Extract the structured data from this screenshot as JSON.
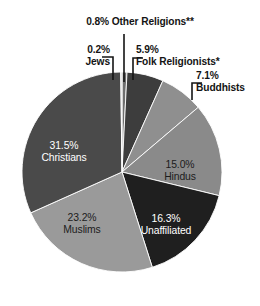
{
  "chart_data": {
    "type": "pie",
    "title": "",
    "subtitle": "",
    "xlabel": "",
    "ylabel": "",
    "legend_position": "none",
    "grid": false,
    "units": "percent",
    "total": 100.0,
    "start_angle_deg": 0,
    "direction": "clockwise",
    "categories": [
      "Other Religions**",
      "Folk Religionists*",
      "Buddhists",
      "Hindus",
      "Unaffiliated",
      "Muslims",
      "Christians",
      "Jews"
    ],
    "values": [
      0.8,
      5.9,
      7.1,
      15.0,
      16.3,
      23.2,
      31.5,
      0.2
    ],
    "slices": [
      {
        "name": "Other Religions**",
        "value": 0.8,
        "pct_label": "0.8%",
        "name_label": "Other Religions**",
        "color": "#6f6f6f",
        "label_placement": "callout",
        "text_color": "#141414"
      },
      {
        "name": "Folk Religionists*",
        "value": 5.9,
        "pct_label": "5.9%",
        "name_label": "Folk Religionists*",
        "color": "#3d3d3d",
        "label_placement": "callout",
        "text_color": "#141414"
      },
      {
        "name": "Buddhists",
        "value": 7.1,
        "pct_label": "7.1%",
        "name_label": "Buddhists",
        "color": "#8f8f8f",
        "label_placement": "callout",
        "text_color": "#141414"
      },
      {
        "name": "Hindus",
        "value": 15.0,
        "pct_label": "15.0%",
        "name_label": "Hindus",
        "color": "#8a8a8a",
        "label_placement": "inside",
        "text_color": "#1c1c1c"
      },
      {
        "name": "Unaffiliated",
        "value": 16.3,
        "pct_label": "16.3%",
        "name_label": "Unaffiliated",
        "color": "#1f1f1f",
        "label_placement": "inside",
        "text_color": "#ffffff"
      },
      {
        "name": "Muslims",
        "value": 23.2,
        "pct_label": "23.2%",
        "name_label": "Muslims",
        "color": "#9a9a9a",
        "label_placement": "inside",
        "text_color": "#1c1c1c"
      },
      {
        "name": "Christians",
        "value": 31.5,
        "pct_label": "31.5%",
        "name_label": "Christians",
        "color": "#4a4a4a",
        "label_placement": "inside",
        "text_color": "#ffffff"
      },
      {
        "name": "Jews",
        "value": 0.2,
        "pct_label": "0.2%",
        "name_label": "Jews",
        "color": "#c9c9c9",
        "label_placement": "callout",
        "text_color": "#141414"
      }
    ],
    "footnote_markers": [
      "*",
      "**"
    ]
  },
  "geometry": {
    "center_x": 122,
    "center_y": 172,
    "radius": 100
  },
  "callouts": {
    "other": {
      "pct": "0.8%",
      "name": "Other Religions**"
    },
    "jews": {
      "pct": "0.2%",
      "name": "Jews"
    },
    "folk": {
      "pct": "5.9%",
      "name": "Folk Religionists*"
    },
    "buddhists": {
      "pct": "7.1%",
      "name": "Buddhists"
    }
  },
  "inside_labels": {
    "christians": {
      "pct": "31.5%",
      "name": "Christians"
    },
    "muslims": {
      "pct": "23.2%",
      "name": "Muslims"
    },
    "unaffiliated": {
      "pct": "16.3%",
      "name": "Unaffiliated"
    },
    "hindus": {
      "pct": "15.0%",
      "name": "Hindus"
    }
  }
}
